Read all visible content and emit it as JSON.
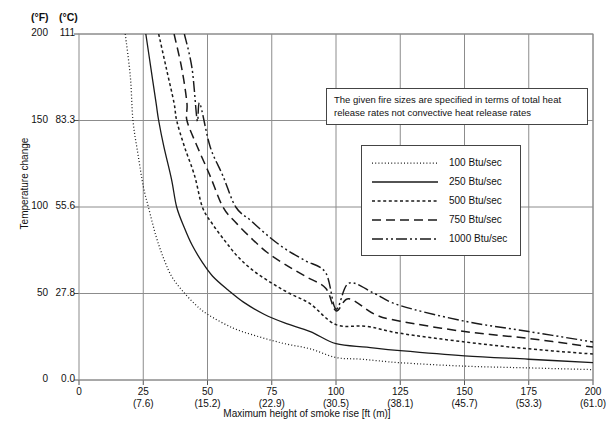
{
  "axes": {
    "unit_f_header": "(°F)",
    "unit_c_header": "(°C)",
    "y_axis_title": "Temperature change",
    "x_axis_title": "Maximum height of smoke rise [ft (m)]",
    "y_ticks_f": [
      "200",
      "150",
      "100",
      "50",
      "0"
    ],
    "y_ticks_c": [
      "111",
      "83.3",
      "55.6",
      "27.8",
      "0.0"
    ],
    "x_ticks_ft": [
      "0",
      "25",
      "50",
      "75",
      "100",
      "125",
      "150",
      "175",
      "200"
    ],
    "x_ticks_m": [
      "",
      "(7.6)",
      "(15.2)",
      "(22.9)",
      "(30.5)",
      "(38.1)",
      "(45.7)",
      "(53.3)",
      "(61.0)"
    ]
  },
  "note": {
    "text": "The given fire sizes are specified in terms of total heat release rates not convective heat release rates"
  },
  "legend": {
    "position": "inside-upper-right",
    "entries": [
      {
        "label": "100 Btu/sec",
        "style": "fine-dotted"
      },
      {
        "label": "250 Btu/sec",
        "style": "solid"
      },
      {
        "label": "500 Btu/sec",
        "style": "dotted"
      },
      {
        "label": "750 Btu/sec",
        "style": "long-dashed"
      },
      {
        "label": "1000 Btu/sec",
        "style": "dash-dot-dot"
      }
    ]
  },
  "chart_data": {
    "type": "line",
    "title": "",
    "xlabel": "Maximum height of smoke rise [ft (m)]",
    "ylabel": "Temperature change",
    "xlim": [
      0,
      200
    ],
    "ylim": [
      0,
      200
    ],
    "y_secondary_lim": [
      0,
      111
    ],
    "grid": true,
    "x_unit": "ft",
    "y_unit": "degF",
    "series": [
      {
        "name": "100 Btu/sec",
        "dash": "fine-dotted",
        "points": [
          [
            18,
            200
          ],
          [
            20,
            175
          ],
          [
            21,
            150
          ],
          [
            23,
            130
          ],
          [
            25,
            112
          ],
          [
            27,
            100
          ],
          [
            30,
            83
          ],
          [
            33,
            70
          ],
          [
            36,
            60
          ],
          [
            40,
            52
          ],
          [
            45,
            44
          ],
          [
            50,
            38
          ],
          [
            60,
            30
          ],
          [
            70,
            25
          ],
          [
            80,
            21
          ],
          [
            90,
            18
          ],
          [
            100,
            13
          ],
          [
            110,
            12
          ],
          [
            125,
            10
          ],
          [
            150,
            8
          ],
          [
            175,
            7
          ],
          [
            200,
            6
          ]
        ]
      },
      {
        "name": "250 Btu/sec",
        "dash": "solid",
        "points": [
          [
            26,
            200
          ],
          [
            28,
            180
          ],
          [
            30,
            160
          ],
          [
            31,
            150
          ],
          [
            33,
            135
          ],
          [
            36,
            116
          ],
          [
            38,
            100
          ],
          [
            41,
            88
          ],
          [
            44,
            78
          ],
          [
            48,
            68
          ],
          [
            52,
            60
          ],
          [
            58,
            52
          ],
          [
            64,
            45
          ],
          [
            72,
            38
          ],
          [
            80,
            33
          ],
          [
            90,
            28
          ],
          [
            100,
            21
          ],
          [
            112,
            19
          ],
          [
            125,
            17
          ],
          [
            150,
            14
          ],
          [
            175,
            12
          ],
          [
            200,
            10
          ]
        ]
      },
      {
        "name": "500 Btu/sec",
        "dash": "dotted",
        "points": [
          [
            31,
            200
          ],
          [
            34,
            180
          ],
          [
            37,
            160
          ],
          [
            38,
            150
          ],
          [
            41,
            135
          ],
          [
            45,
            118
          ],
          [
            48,
            100
          ],
          [
            52,
            90
          ],
          [
            57,
            80
          ],
          [
            62,
            71
          ],
          [
            68,
            63
          ],
          [
            75,
            56
          ],
          [
            82,
            50
          ],
          [
            90,
            44
          ],
          [
            100,
            32
          ],
          [
            112,
            31
          ],
          [
            125,
            27
          ],
          [
            150,
            22
          ],
          [
            175,
            18
          ],
          [
            200,
            15
          ]
        ]
      },
      {
        "name": "750 Btu/sec",
        "dash": "long-dashed",
        "points": [
          [
            37,
            200
          ],
          [
            40,
            180
          ],
          [
            42,
            160
          ],
          [
            42,
            150
          ],
          [
            46,
            135
          ],
          [
            51,
            118
          ],
          [
            56,
            100
          ],
          [
            61,
            91
          ],
          [
            67,
            82
          ],
          [
            73,
            74
          ],
          [
            80,
            67
          ],
          [
            88,
            60
          ],
          [
            96,
            53
          ],
          [
            105,
            47
          ],
          [
            100,
            40
          ],
          [
            115,
            38
          ],
          [
            125,
            34
          ],
          [
            150,
            28
          ],
          [
            175,
            24
          ],
          [
            200,
            19
          ]
        ]
      },
      {
        "name": "1000 Btu/sec",
        "dash": "dash-dot-dot",
        "points": [
          [
            41,
            200
          ],
          [
            44,
            180
          ],
          [
            47,
            160
          ],
          [
            46,
            150
          ],
          [
            51,
            135
          ],
          [
            56,
            118
          ],
          [
            61,
            100
          ],
          [
            67,
            92
          ],
          [
            73,
            84
          ],
          [
            80,
            76
          ],
          [
            88,
            69
          ],
          [
            96,
            62
          ],
          [
            105,
            56
          ],
          [
            115,
            50
          ],
          [
            100,
            41
          ],
          [
            125,
            43
          ],
          [
            150,
            34
          ],
          [
            175,
            28
          ],
          [
            200,
            22
          ]
        ]
      }
    ]
  }
}
